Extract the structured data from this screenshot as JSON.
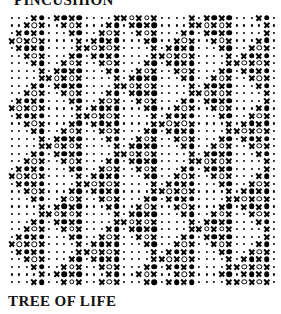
{
  "titles": {
    "top": "PINCUSHION",
    "bottom": "TREE OF LIFE"
  },
  "colors": {
    "ink": "#000000",
    "background": "#ffffff",
    "text": "#111111"
  },
  "chart_data": {
    "type": "heatmap",
    "title": "PINCUSHION",
    "subtitle": "TREE OF LIFE",
    "xlabel": "",
    "ylabel": "",
    "grid": false,
    "legend_position": "none",
    "symbol_legend": {
      ".": "dot",
      "X": "cross",
      "O": "open-circle",
      "#": "filled-circle"
    },
    "columns": 36,
    "rows": 36,
    "x": [
      1,
      2,
      3,
      4,
      5,
      6,
      7,
      8,
      9,
      10,
      11,
      12,
      13,
      14,
      15,
      16,
      17,
      18,
      19,
      20,
      21,
      22,
      23,
      24,
      25,
      26,
      27,
      28,
      29,
      30,
      31,
      32,
      33,
      34,
      35,
      36
    ],
    "rows_data": [
      "...X#.X#X#....XXOXOX....X.X#X#...X#.",
      "..XOX..XOX...X#.X#X#....XXOXOX....X.",
      ".X#X#...X#..XOX..XOX...X#.X#X#....X.",
      "XOXOX....X.X#X#...X#..XOX..XOX...X#.",
      ".X#X#....XXOXOX....X.X#X#...X#..XOX.",
      "..XOX...X#.X#X#....XXOXOX....X.X#X#.",
      "...X#..XOX..XOX...X#.X#X#....XXOXOX.",
      "....X.X#X#...X#..XOX..XOX...X#.X#X#.",
      "....XXOXOX....X.X#X#...X#..XOX..XOX.",
      "...X#.X#X#....XXOXOX....X.X#X#...X#.",
      "..XOX..XOX...X#.X#X#....XXOXOX....X.",
      ".X#X#...X#..XOX..XOX...X#.X#X#....X.",
      "XOXOX....X.X#X#...X#..XOX..XOX...X#.",
      ".X#X#....XXOXOX....X.X#X#...X#..XOX.",
      "..XOX...X#.X#X#....XXOXOX....X.X#X#.",
      "...X#..XOX..XOX...X#.X#X#....XXOXOX.",
      "....X.X#X#...X#..XOX..XOX...X#.X#X#.",
      "....XXOXOX....X.X#X#...X#..XOX..XOX.",
      "...X#.X#X#....XXOXOX....X.X#X#...X#.",
      "..XOX..XOX...X#.X#X#....XXOXOX....X.",
      ".X#X#...X#..XOX..XOX...X#.X#X#....X.",
      "XOXOX....X.X#X#...X#..XOX..XOX...X#.",
      ".X#X#....XXOXOX....X.X#X#...X#..XOX.",
      "..XOX...X#.X#X#....XXOXOX....X.X#X#.",
      "...X#..XOX..XOX...X#.X#X#....XXOXOX.",
      "....X.X#X#...X#..XOX..XOX...X#.X#X#.",
      "....XXOXOX....X.X#X#...X#..XOX..XOX.",
      "...X#.X#X#....XXOXOX....X.X#X#...X#.",
      "..XOX..XOX...X#.X#X#....XXOXOX....X.",
      ".X#X#...X#..XOX..XOX...X#.X#X#....X.",
      "XOXOX....X.X#X#...X#..XOX..XOX...X#.",
      ".X#X#....XXOXOX....X.X#X#...X#..XOX.",
      "..XOX...X#.X#X#....XXOXOX....X.X#X#.",
      "...X#..XOX..XOX...X#.X#X#....XXOXOX.",
      "....X.X#X#...X#..XOX..XOX...X#.X#X#.",
      "...X#..XOX..XOX...X#.X#X#....XXOXOX."
    ]
  }
}
